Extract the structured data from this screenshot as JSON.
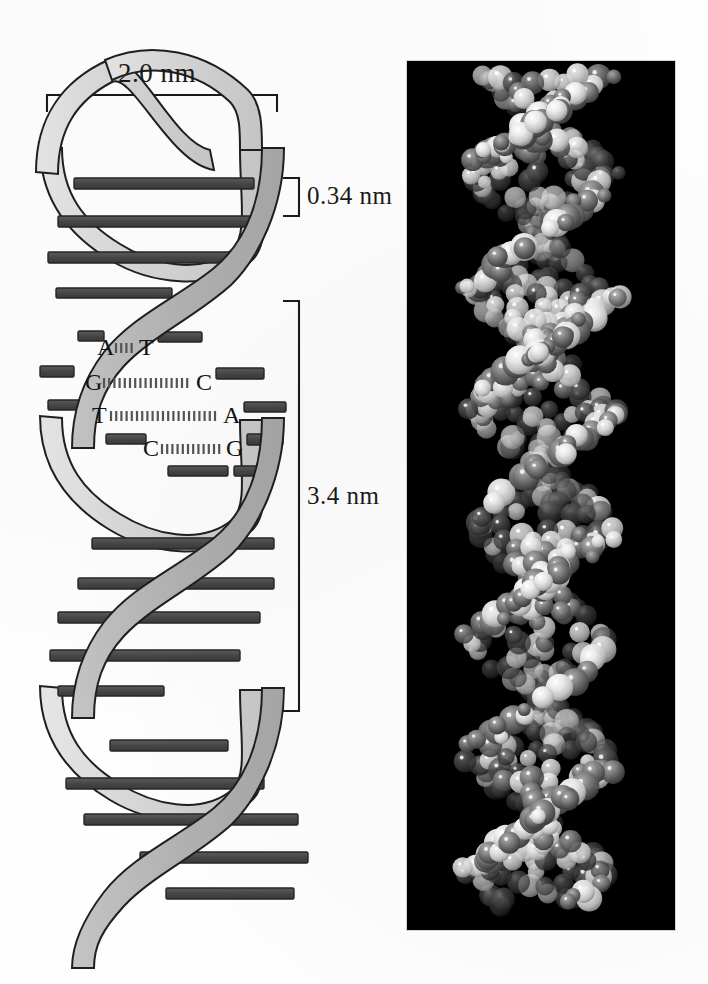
{
  "figure": {
    "background_color": "#ffffff"
  },
  "measurements": [
    {
      "id": "width",
      "label": "2.0 nm",
      "orientation": "horizontal",
      "describes": "helix diameter"
    },
    {
      "id": "rise",
      "label": "0.34 nm",
      "orientation": "vertical",
      "describes": "rise per base pair"
    },
    {
      "id": "pitch",
      "label": "3.4 nm",
      "orientation": "vertical",
      "describes": "one full helical turn"
    }
  ],
  "helix": {
    "strand_front_color": "#b9b9b9",
    "strand_back_color": "#d9d9d9",
    "rung_color": "#4a4a4a",
    "outline_color": "#1a1a1a",
    "turns": 3
  },
  "base_pairs": [
    {
      "left": "A",
      "right": "T",
      "bonds": 3,
      "left_x": 97,
      "right_x": 139,
      "y": 335
    },
    {
      "left": "G",
      "right": "C",
      "bonds": 3,
      "left_x": 85,
      "right_x": 196,
      "y": 370
    },
    {
      "left": "T",
      "right": "A",
      "bonds": 2,
      "left_x": 92,
      "right_x": 223,
      "y": 403
    },
    {
      "left": "C",
      "right": "G",
      "bonds": 3,
      "left_x": 143,
      "right_x": 226,
      "y": 436
    }
  ],
  "space_filling_model": {
    "caption": "",
    "background_color": "#000000",
    "atom_dark_color": "#4f4f4f",
    "atom_light_color": "#efefef",
    "highlight_color": "#ffffff",
    "panel": {
      "x": 407,
      "y": 61,
      "width": 268,
      "height": 869
    }
  },
  "chart_data": {
    "type": "diagram",
    "annotations": [
      {
        "label": "2.0 nm",
        "value": 2.0,
        "unit": "nm",
        "meaning": "diameter of the double helix"
      },
      {
        "label": "0.34 nm",
        "value": 0.34,
        "unit": "nm",
        "meaning": "distance between adjacent base pairs (rise)"
      },
      {
        "label": "3.4 nm",
        "value": 3.4,
        "unit": "nm",
        "meaning": "length of one complete helical turn (pitch)"
      }
    ],
    "base_pairing": [
      {
        "pair": "A-T",
        "hydrogen_bonds": 3
      },
      {
        "pair": "G-C",
        "hydrogen_bonds": 3
      },
      {
        "pair": "T-A",
        "hydrogen_bonds": 2
      },
      {
        "pair": "C-G",
        "hydrogen_bonds": 3
      }
    ],
    "base_pairs_per_turn": 10
  }
}
